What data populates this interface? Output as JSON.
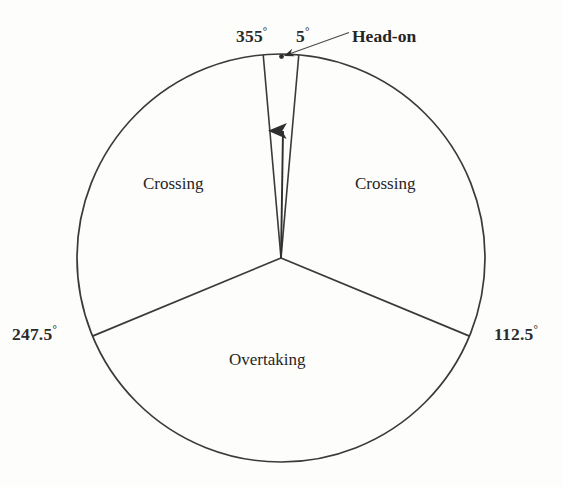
{
  "figure": {
    "type": "sector-diagram",
    "background_color": "#fdfdfc",
    "line_color": "#3a3a3a",
    "text_color": "#2b2b2b"
  },
  "geometry": {
    "center_x": 281,
    "center_y": 258,
    "radius": 204
  },
  "angle_labels": {
    "top_left": {
      "value": "355",
      "degree_symbol": "°"
    },
    "top_right": {
      "value": "5",
      "degree_symbol": "°"
    },
    "right": {
      "value": "112.5",
      "degree_symbol": "°"
    },
    "left": {
      "value": "247.5",
      "degree_symbol": "°"
    }
  },
  "sectors": [
    {
      "name": "head-on",
      "label": "Head-on",
      "start_deg": 355,
      "end_deg": 5
    },
    {
      "name": "crossing-right",
      "label": "Crossing",
      "start_deg": 5,
      "end_deg": 112.5
    },
    {
      "name": "overtaking",
      "label": "Overtaking",
      "start_deg": 112.5,
      "end_deg": 247.5
    },
    {
      "name": "crossing-left",
      "label": "Crossing",
      "start_deg": 247.5,
      "end_deg": 355
    }
  ],
  "callout": {
    "label": "Head-on",
    "pointer_target_x": 281,
    "pointer_target_y": 56
  },
  "heading_arrow": {
    "from_x": 281,
    "from_y": 258,
    "to_x": 283,
    "to_y": 124,
    "direction": "up"
  },
  "chart_data": {
    "type": "pie",
    "title": "",
    "categories": [
      "Head-on",
      "Crossing (starboard)",
      "Overtaking",
      "Crossing (port)"
    ],
    "values": [
      10,
      107.5,
      135,
      107.5
    ],
    "unit": "degrees",
    "boundaries_deg": [
      355,
      5,
      112.5,
      247.5
    ],
    "tick_labels": [
      "355°",
      "5°",
      "112.5°",
      "247.5°"
    ],
    "labels": [
      "Head-on",
      "Crossing",
      "Overtaking",
      "Crossing"
    ],
    "legend": "none",
    "grid": false,
    "xlabel": "",
    "ylabel": ""
  }
}
